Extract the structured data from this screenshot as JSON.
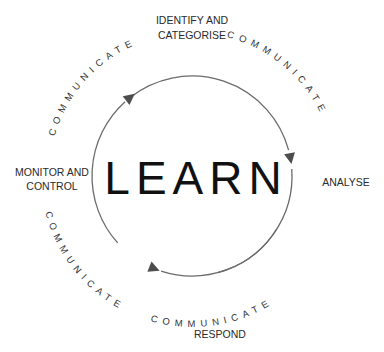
{
  "diagram": {
    "center_label": "LEARN",
    "stages": [
      {
        "id": "identify",
        "lines": [
          "IDENTIFY AND",
          "CATEGORISE"
        ]
      },
      {
        "id": "analyse",
        "lines": [
          "ANALYSE"
        ]
      },
      {
        "id": "respond",
        "lines": [
          "RESPOND"
        ]
      },
      {
        "id": "monitor",
        "lines": [
          "MONITOR AND",
          "CONTROL"
        ]
      }
    ],
    "connectors": [
      {
        "label": "COMMUNICATE"
      },
      {
        "label": "COMMUNICATE"
      },
      {
        "label": "COMMUNICATE"
      },
      {
        "label": "COMMUNICATE"
      }
    ],
    "colors": {
      "arc": "#6b6b6b",
      "arrow": "#4d4d4d",
      "text": "#2a2a2a"
    }
  }
}
